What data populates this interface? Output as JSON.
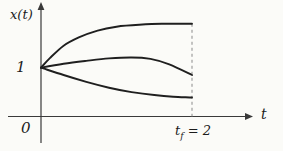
{
  "figure": {
    "ylabel": "x(t)",
    "xlabel": "t",
    "origin_label": "0",
    "initial_value_label": "1",
    "tf_label": {
      "base": "t",
      "sub": "f",
      "rest": " = 2"
    }
  },
  "chart_data": {
    "type": "line",
    "title": "",
    "xlabel": "t",
    "ylabel": "x(t)",
    "xlim": [
      0,
      2.8
    ],
    "ylim": [
      0,
      2.3
    ],
    "grid": false,
    "legend": "none",
    "x_ticks": [
      {
        "value": 2,
        "label": "t_f = 2"
      }
    ],
    "y_ticks": [
      {
        "value": 1,
        "label": "1"
      }
    ],
    "origin_label": "0",
    "annotations": [
      "dashed vertical line at t = 2 from the x-axis up to the upper trajectory"
    ],
    "series": [
      {
        "name": "upper-trajectory",
        "points": [
          [
            0,
            1.0
          ],
          [
            0.12,
            1.2
          ],
          [
            0.3,
            1.45
          ],
          [
            0.5,
            1.62
          ],
          [
            0.75,
            1.76
          ],
          [
            1.0,
            1.84
          ],
          [
            1.3,
            1.88
          ],
          [
            1.6,
            1.9
          ],
          [
            2.0,
            1.9
          ]
        ]
      },
      {
        "name": "middle-trajectory",
        "points": [
          [
            0,
            1.0
          ],
          [
            0.3,
            1.08
          ],
          [
            0.6,
            1.14
          ],
          [
            0.9,
            1.19
          ],
          [
            1.2,
            1.21
          ],
          [
            1.45,
            1.18
          ],
          [
            1.7,
            1.07
          ],
          [
            2.0,
            0.85
          ]
        ]
      },
      {
        "name": "lower-trajectory",
        "points": [
          [
            0,
            1.0
          ],
          [
            0.3,
            0.85
          ],
          [
            0.6,
            0.71
          ],
          [
            0.9,
            0.59
          ],
          [
            1.2,
            0.5
          ],
          [
            1.5,
            0.44
          ],
          [
            1.75,
            0.405
          ],
          [
            2.0,
            0.39
          ]
        ]
      }
    ],
    "stroke_color": "#1f1f1f",
    "axis_color": "#3a3a3a",
    "dashed_line_color": "#8a8a8a"
  }
}
